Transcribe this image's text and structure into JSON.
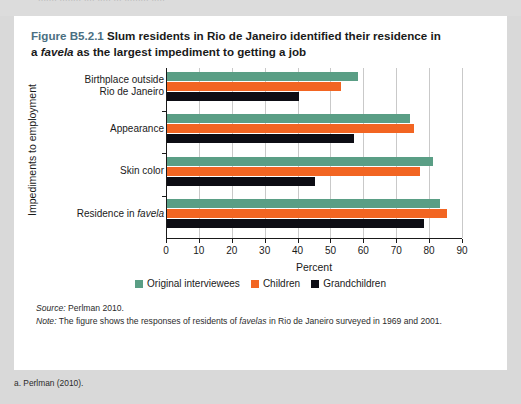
{
  "page": {
    "top_bleed_text": "....... ........ .... ..... ... ......... ....."
  },
  "figure": {
    "number": "Figure B5.2.1",
    "title_part1": "Slum residents in Rio de Janeiro identified their residence in",
    "title_part2_pre": "a ",
    "title_part2_italic": "favela",
    "title_part2_post": " as the largest impediment to getting a job"
  },
  "notes": {
    "source_label": "Source:",
    "source_text": " Perlman 2010.",
    "note_label": "Note:",
    "note_pre": " The figure shows the responses of residents of ",
    "note_italic": "favelas",
    "note_post": " in Rio de Janeiro surveyed in 1969 and 2001."
  },
  "footnote": {
    "text": "a. Perlman (2010)."
  },
  "chart_data": {
    "type": "bar",
    "orientation": "horizontal",
    "title": "Slum residents in Rio de Janeiro identified their residence in a favela as the largest impediment to getting a job",
    "xlabel": "Percent",
    "ylabel": "Impediments to employment",
    "xlim": [
      0,
      90
    ],
    "xticks": [
      0,
      10,
      20,
      30,
      40,
      50,
      60,
      70,
      80,
      90
    ],
    "grid": true,
    "legend_position": "bottom",
    "categories": [
      "Birthplace outside Rio de Janeiro",
      "Appearance",
      "Skin color",
      "Residence in favela"
    ],
    "category_labels": [
      {
        "line1": "Birthplace outside",
        "line2": "Rio de Janeiro",
        "italic": ""
      },
      {
        "line1": "Appearance",
        "line2": "",
        "italic": ""
      },
      {
        "line1": "Skin color",
        "line2": "",
        "italic": ""
      },
      {
        "line1": "Residence in ",
        "line2": "",
        "italic": "favela"
      }
    ],
    "series": [
      {
        "name": "Original interviewees",
        "color": "#5a9e85",
        "values": [
          58,
          74,
          81,
          83
        ]
      },
      {
        "name": "Children",
        "color": "#f26522",
        "values": [
          53,
          75,
          77,
          85
        ]
      },
      {
        "name": "Grandchildren",
        "color": "#0d0d14",
        "values": [
          40,
          57,
          45,
          78
        ]
      }
    ]
  }
}
